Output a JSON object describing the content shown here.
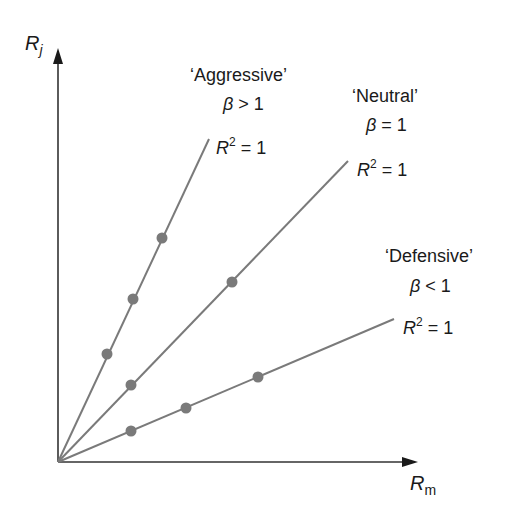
{
  "diagram": {
    "axes": {
      "y_label": "R",
      "y_label_sub": "j",
      "x_label": "R",
      "x_label_sub": "m",
      "origin": [
        58,
        462
      ],
      "y_axis_top": [
        58,
        50
      ],
      "x_axis_end": [
        416,
        462
      ]
    },
    "colors": {
      "axis": "#333333",
      "line": "#7a7a7a",
      "point": "#7a7a7a",
      "text": "#1a1a1a"
    },
    "lines": [
      {
        "name": "aggressive",
        "title": "‘Aggressive’",
        "beta_symbol": "β",
        "beta_text": " > 1",
        "r2_base": "R",
        "r2_sup": "2",
        "r2_text": " = 1",
        "end": [
          209,
          139
        ],
        "points": [
          [
            107,
            354
          ],
          [
            133,
            299
          ],
          [
            162,
            238
          ]
        ]
      },
      {
        "name": "neutral",
        "title": "‘Neutral’",
        "beta_symbol": "β",
        "beta_text": " = 1",
        "r2_base": "R",
        "r2_sup": "2",
        "r2_text": " = 1",
        "end": [
          348,
          161
        ],
        "points": [
          [
            131,
            385
          ],
          [
            232,
            282
          ]
        ]
      },
      {
        "name": "defensive",
        "title": "‘Defensive’",
        "beta_symbol": "β",
        "beta_text": " < 1",
        "r2_base": "R",
        "r2_sup": "2",
        "r2_text": " = 1",
        "end": [
          394,
          319
        ],
        "points": [
          [
            131,
            431
          ],
          [
            186,
            408
          ],
          [
            258,
            377
          ]
        ]
      }
    ]
  }
}
